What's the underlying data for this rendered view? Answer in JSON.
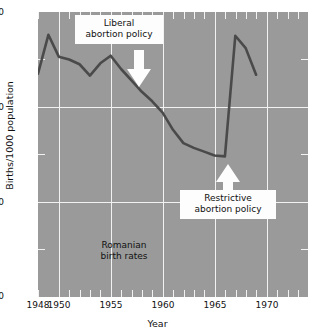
{
  "chart_data": {
    "type": "line",
    "title": "",
    "xlabel": "Year",
    "ylabel": "Births/1000 population",
    "xlim": [
      1948,
      1974
    ],
    "ylim": [
      0,
      30
    ],
    "xticks_labeled": [
      1948,
      1950,
      1955,
      1960,
      1965,
      1970
    ],
    "yticks_labeled": [
      0,
      10,
      20,
      30
    ],
    "yticks_minor": [
      5,
      15,
      25
    ],
    "xtick_interval": 1,
    "grid": true,
    "grid_color": "#f2f2f2",
    "plot_background": "#9a9a9a",
    "line_color": "#4a4a4a",
    "legend": "none",
    "series": [
      {
        "name": "Romanian birth rates",
        "x": [
          1948,
          1949,
          1950,
          1951,
          1952,
          1953,
          1954,
          1955,
          1956,
          1957,
          1958,
          1959,
          1960,
          1961,
          1962,
          1963,
          1964,
          1965,
          1966,
          1967,
          1968,
          1969
        ],
        "values": [
          23.5,
          27.6,
          25.3,
          25.0,
          24.5,
          23.3,
          24.6,
          25.4,
          24.0,
          22.8,
          21.6,
          20.6,
          19.4,
          17.6,
          16.2,
          15.7,
          15.3,
          14.9,
          14.8,
          27.5,
          26.2,
          23.4
        ]
      }
    ],
    "annotations": [
      {
        "id": "liberal-policy",
        "lines": [
          "Liberal",
          "abortion policy"
        ],
        "points_to_year": 1957,
        "arrow_direction": "down"
      },
      {
        "id": "restrictive-policy",
        "lines": [
          "Restrictive",
          "abortion policy"
        ],
        "points_to_year": 1966,
        "arrow_direction": "up"
      },
      {
        "id": "series-label",
        "lines": [
          "Romanian",
          "birth rates"
        ],
        "arrow_direction": "none"
      }
    ]
  },
  "axes": {
    "y_title": "Births/1000 population",
    "x_title": "Year",
    "y_tick_labels": [
      "30",
      "20",
      "10",
      "0"
    ],
    "x_tick_labels": [
      "1948",
      "1950",
      "1955",
      "1960",
      "1965",
      "1970"
    ]
  },
  "annotations": {
    "liberal": {
      "line1": "Liberal",
      "line2": "abortion policy"
    },
    "restrictive": {
      "line1": "Restrictive",
      "line2": "abortion policy"
    },
    "series_label": {
      "line1": "Romanian",
      "line2": "birth rates"
    }
  },
  "colors": {
    "plot_background": "#9a9a9a",
    "grid": "#f2f2f2",
    "line": "#4a4a4a",
    "callout_background": "#fdfdfd",
    "text": "#111111"
  }
}
